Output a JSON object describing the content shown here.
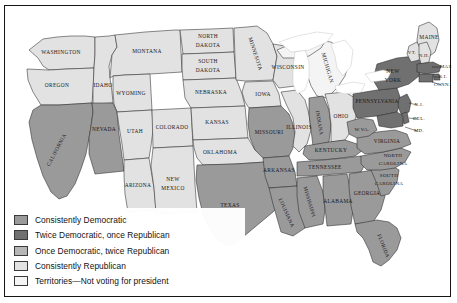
{
  "figure": {
    "kind": "thematic-choropleth-map",
    "region": "United States",
    "title_visible": false
  },
  "palette": {
    "consistently_democratic": "#9a9a9a",
    "twice_democratic_once_republican": "#707070",
    "once_democratic_twice_republican": "#b6b6b6",
    "consistently_republican": "#e2e2e2",
    "territories_not_voting": "#f4f4f4",
    "water": "#ffffff",
    "border": "#2a2a2a",
    "frame": "#151515",
    "label": "#17171a",
    "background": "#ffffff"
  },
  "legend": {
    "items": [
      {
        "label": "Consistently Democratic",
        "color_key": "consistently_democratic",
        "color": "#9a9a9a"
      },
      {
        "label": "Twice Democratic, once Republican",
        "color_key": "twice_democratic_once_republican",
        "color": "#707070"
      },
      {
        "label": "Once Democratic, twice Republican",
        "color_key": "once_democratic_twice_republican",
        "color": "#b6b6b6"
      },
      {
        "label": "Consistently Republican",
        "color_key": "consistently_republican",
        "color": "#e2e2e2"
      },
      {
        "label": "Territories—Not voting for president",
        "color_key": "territories_not_voting",
        "color": "#f4f4f4"
      }
    ]
  },
  "map_data": {
    "type": "choropleth",
    "category_count": 5,
    "states": [
      {
        "name": "WASHINGTON",
        "category": "consistently_republican"
      },
      {
        "name": "OREGON",
        "category": "consistently_republican"
      },
      {
        "name": "IDAHO",
        "category": "consistently_republican"
      },
      {
        "name": "MONTANA",
        "category": "consistently_republican"
      },
      {
        "name": "WYOMING",
        "category": "consistently_republican"
      },
      {
        "name": "CALIFORNIA",
        "category": "consistently_democratic"
      },
      {
        "name": "NEVADA",
        "category": "consistently_democratic"
      },
      {
        "name": "UTAH",
        "category": "consistently_republican"
      },
      {
        "name": "ARIZONA",
        "category": "consistently_republican"
      },
      {
        "name": "COLORADO",
        "category": "consistently_republican"
      },
      {
        "name": "NEW MEXICO",
        "category": "consistently_republican"
      },
      {
        "name": "NORTH DAKOTA",
        "category": "consistently_republican"
      },
      {
        "name": "SOUTH DAKOTA",
        "category": "consistently_republican"
      },
      {
        "name": "NEBRASKA",
        "category": "consistently_republican"
      },
      {
        "name": "KANSAS",
        "category": "consistently_republican"
      },
      {
        "name": "OKLAHOMA",
        "category": "consistently_republican"
      },
      {
        "name": "TEXAS",
        "category": "consistently_democratic"
      },
      {
        "name": "MINNESOTA",
        "category": "consistently_republican"
      },
      {
        "name": "IOWA",
        "category": "consistently_republican"
      },
      {
        "name": "MISSOURI",
        "category": "consistently_democratic"
      },
      {
        "name": "ARKANSAS",
        "category": "consistently_democratic"
      },
      {
        "name": "LOUISIANA",
        "category": "consistently_democratic"
      },
      {
        "name": "WISCONSIN",
        "category": "consistently_republican"
      },
      {
        "name": "MICHIGAN",
        "category": "territories_not_voting"
      },
      {
        "name": "ILLINOIS",
        "category": "consistently_republican"
      },
      {
        "name": "INDIANA",
        "category": "consistently_democratic"
      },
      {
        "name": "OHIO",
        "category": "consistently_republican"
      },
      {
        "name": "KENTUCKY",
        "category": "consistently_democratic"
      },
      {
        "name": "TENNESSEE",
        "category": "consistently_democratic"
      },
      {
        "name": "MISSISSIPPI",
        "category": "consistently_democratic"
      },
      {
        "name": "ALABAMA",
        "category": "consistently_democratic"
      },
      {
        "name": "GEORGIA",
        "category": "consistently_democratic"
      },
      {
        "name": "FLORIDA",
        "category": "consistently_democratic"
      },
      {
        "name": "SOUTH CAROLINA",
        "category": "consistently_democratic"
      },
      {
        "name": "NORTH CAROLINA",
        "category": "consistently_democratic"
      },
      {
        "name": "VIRGINIA",
        "category": "consistently_democratic"
      },
      {
        "name": "W.VA.",
        "category": "consistently_democratic"
      },
      {
        "name": "PENNSYLVANIA",
        "category": "twice_democratic_once_republican"
      },
      {
        "name": "NEW YORK",
        "category": "twice_democratic_once_republican"
      },
      {
        "name": "MAINE",
        "category": "consistently_republican"
      },
      {
        "name": "VT.",
        "category": "consistently_republican"
      },
      {
        "name": "N.H.",
        "category": "consistently_republican"
      },
      {
        "name": "MASS.",
        "category": "twice_democratic_once_republican"
      },
      {
        "name": "R.I.",
        "category": "twice_democratic_once_republican"
      },
      {
        "name": "CONN.",
        "category": "twice_democratic_once_republican"
      },
      {
        "name": "N.J.",
        "category": "twice_democratic_once_republican"
      },
      {
        "name": "DEL.",
        "category": "twice_democratic_once_republican"
      },
      {
        "name": "MD.",
        "category": "twice_democratic_once_republican"
      }
    ],
    "callout_labels": [
      "MASS.",
      "R.I.",
      "CONN.",
      "N.J.",
      "DEL.",
      "MD."
    ],
    "rotated_labels": [
      "CALIFORNIA",
      "MINNESOTA",
      "MICHIGAN",
      "INDIANA",
      "MISSISSIPPI",
      "LOUISIANA",
      "FLORIDA"
    ]
  }
}
